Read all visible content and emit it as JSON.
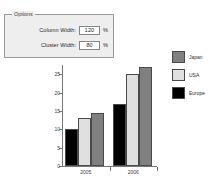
{
  "options": {
    "title": "Options",
    "fields": [
      {
        "name": "column-width",
        "label": "Column Width:",
        "value": "120",
        "unit": "%",
        "placeholder": "100"
      },
      {
        "name": "cluster-width",
        "label": "Cluster Width:",
        "value": "80",
        "unit": "%",
        "placeholder": "100"
      }
    ]
  },
  "colors": {
    "japan": "#808080",
    "usa": "#e0e0e0",
    "europe": "#000000",
    "axis": "#777777",
    "panel_bg": "#eeeeee",
    "panel_border": "#9a9a9a",
    "input_border": "#868686"
  },
  "legend": {
    "position": "right",
    "entries": [
      {
        "label": "Japan",
        "color": "#808080"
      },
      {
        "label": "USA",
        "color": "#e0e0e0"
      },
      {
        "label": "Europe",
        "color": "#000000"
      }
    ]
  },
  "chart_data": {
    "type": "bar",
    "title": "",
    "subtitle": "",
    "xlabel": "",
    "ylabel": "",
    "grid": false,
    "ylim": [
      0,
      27.5
    ],
    "yticks": [
      0,
      5,
      10,
      15,
      20,
      25
    ],
    "ytick_labels": [
      "0",
      "5",
      "10",
      "15",
      "20",
      "25"
    ],
    "categories": [
      "2005",
      "2006"
    ],
    "series": [
      {
        "name": "Europe",
        "color": "#000000",
        "values": [
          10,
          17
        ]
      },
      {
        "name": "USA",
        "color": "#e0e0e0",
        "values": [
          13,
          25
        ]
      },
      {
        "name": "Japan",
        "color": "#808080",
        "values": [
          14.5,
          27
        ]
      }
    ]
  }
}
